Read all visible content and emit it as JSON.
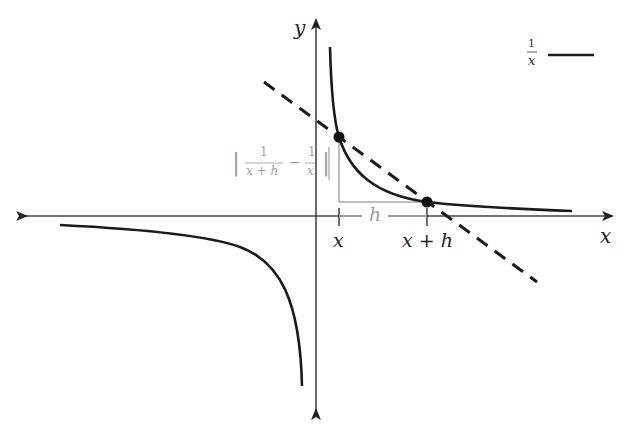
{
  "diagram": {
    "axes": {
      "x_label": "x",
      "y_label": "y"
    },
    "legend": {
      "numerator": "1",
      "denominator": "x",
      "line_style": "solid"
    },
    "ticks": {
      "x_label": "x",
      "xh_label": "x + h"
    },
    "run_label": "h",
    "rise_label": {
      "left_bar": "|",
      "frac1_num": "1",
      "frac1_den": "x + h",
      "minus": "−",
      "frac2_num": "1",
      "frac2_den": "x",
      "right_bar": "|"
    },
    "points": [
      {
        "name": "point-x",
        "label": "(x, 1/x)"
      },
      {
        "name": "point-x-plus-h",
        "label": "(x+h, 1/(x+h))"
      }
    ],
    "colors": {
      "curve": "#1a1a1a",
      "axes": "#333333",
      "secant": "#1a1a1a",
      "annotation_gray": "#a0a0a0"
    }
  }
}
